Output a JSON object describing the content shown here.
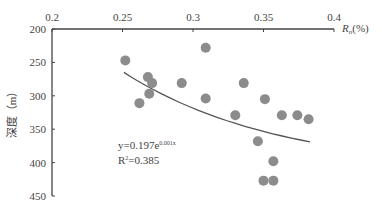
{
  "chart_data": {
    "type": "scatter",
    "title": "",
    "xlabel": "Ro(%)",
    "ylabel": "深度(m)",
    "xlim": [
      0.2,
      0.4
    ],
    "ylim": [
      450,
      200
    ],
    "x_ticks": [
      "0.2",
      "0.25",
      "0.3",
      "0.35",
      "0.4"
    ],
    "y_ticks": [
      "200",
      "250",
      "300",
      "350",
      "400",
      "450"
    ],
    "points": [
      {
        "x": 0.252,
        "y": 247
      },
      {
        "x": 0.268,
        "y": 272
      },
      {
        "x": 0.271,
        "y": 281
      },
      {
        "x": 0.292,
        "y": 281
      },
      {
        "x": 0.269,
        "y": 297
      },
      {
        "x": 0.262,
        "y": 311
      },
      {
        "x": 0.309,
        "y": 228
      },
      {
        "x": 0.309,
        "y": 304
      },
      {
        "x": 0.336,
        "y": 281
      },
      {
        "x": 0.351,
        "y": 305
      },
      {
        "x": 0.33,
        "y": 329
      },
      {
        "x": 0.363,
        "y": 329
      },
      {
        "x": 0.374,
        "y": 329
      },
      {
        "x": 0.382,
        "y": 335
      },
      {
        "x": 0.346,
        "y": 368
      },
      {
        "x": 0.357,
        "y": 398
      },
      {
        "x": 0.35,
        "y": 427
      },
      {
        "x": 0.357,
        "y": 427
      }
    ],
    "trendline": {
      "type": "exponential",
      "equation": "y=0.197e^0.001x",
      "r2": "R²=0.385",
      "x_range": [
        0.251,
        0.383
      ],
      "y_range": [
        265,
        369
      ]
    },
    "grid": false
  },
  "labels": {
    "eq_main": "y=0.197e",
    "eq_exp": "0.001x",
    "r2_main": "R",
    "r2_sup": "2",
    "r2_val": "=0.385",
    "xaxis_main": "R",
    "xaxis_sub": "o",
    "xaxis_unit": "(%)",
    "yaxis": "深度（m）"
  }
}
